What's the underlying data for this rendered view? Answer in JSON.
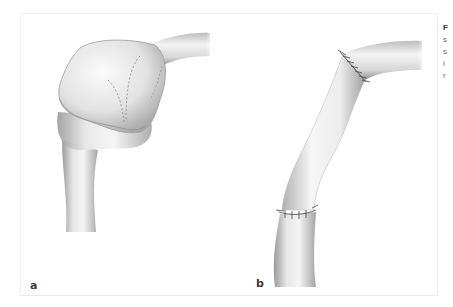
{
  "figure": {
    "panels": [
      {
        "label": "a",
        "description": "Saccular aneurysm with dashed incision lines on vessel"
      },
      {
        "label": "b",
        "description": "Vessel segment replaced with interposition graft, sutured at both anastomoses"
      }
    ],
    "caption_lines": [
      "F",
      "s",
      "s",
      "i",
      "r"
    ],
    "colors": {
      "background": "#ffffff",
      "frame": "#eeeeee",
      "vessel_light": "#f2f2f2",
      "vessel_shadow": "#8a8a8a",
      "suture": "#444444"
    }
  }
}
